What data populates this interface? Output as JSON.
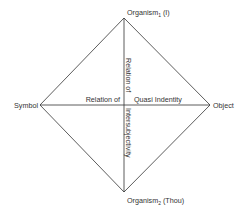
{
  "diagram": {
    "vertices": {
      "top": {
        "label": "Organism",
        "subscript": "1",
        "suffix": " (I)"
      },
      "bottom": {
        "label": "Organism",
        "subscript": "2",
        "suffix": " (Thou)"
      },
      "left": {
        "label": "Symbol"
      },
      "right": {
        "label": "Object"
      }
    },
    "horizontal_axis": {
      "left_label": "Relation of",
      "right_label": "Quasi Indentity"
    },
    "vertical_axis": {
      "top_label": "Relation of",
      "bottom_label": "Intersubjectivity"
    },
    "colors": {
      "line": "#333333",
      "text": "#333333",
      "background": "#ffffff"
    }
  }
}
